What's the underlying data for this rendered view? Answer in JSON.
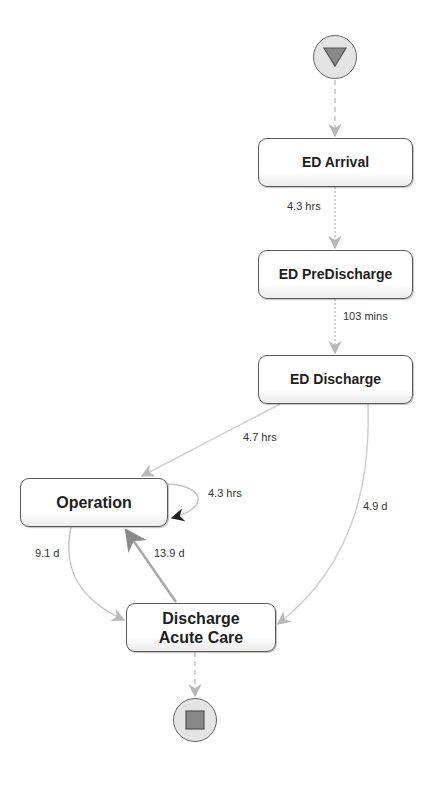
{
  "diagram": {
    "type": "process-map",
    "colors": {
      "node_border": "#5a5a5a",
      "node_fill": "#ffffff",
      "edge": "#c4c4c4",
      "edge_dark": "#8a8a8a",
      "terminal_fill": "#e4e4e4",
      "terminal_glyph": "#888888",
      "self_loop_arrow": "#222222"
    },
    "start_node": {
      "icon": "start-triangle-icon"
    },
    "end_node": {
      "icon": "end-square-icon"
    },
    "nodes": [
      {
        "id": "ed_arrival",
        "label": "ED Arrival"
      },
      {
        "id": "ed_predischarge",
        "label": "ED PreDischarge"
      },
      {
        "id": "ed_discharge",
        "label": "ED Discharge"
      },
      {
        "id": "operation",
        "label": "Operation"
      },
      {
        "id": "discharge_acute_care",
        "label_line1": "Discharge",
        "label_line2": "Acute Care"
      }
    ],
    "edges": [
      {
        "from": "start",
        "to": "ed_arrival",
        "label": ""
      },
      {
        "from": "ed_arrival",
        "to": "ed_predischarge",
        "label": "4.3 hrs"
      },
      {
        "from": "ed_predischarge",
        "to": "ed_discharge",
        "label": "103 mins"
      },
      {
        "from": "ed_discharge",
        "to": "operation",
        "label": "4.7 hrs"
      },
      {
        "from": "operation",
        "to": "operation",
        "label": "4.3 hrs"
      },
      {
        "from": "ed_discharge",
        "to": "discharge_acute_care",
        "label": "4.9 d"
      },
      {
        "from": "operation",
        "to": "discharge_acute_care",
        "label": "9.1 d"
      },
      {
        "from": "discharge_acute_care",
        "to": "operation",
        "label": "13.9 d"
      },
      {
        "from": "discharge_acute_care",
        "to": "end",
        "label": ""
      }
    ]
  }
}
